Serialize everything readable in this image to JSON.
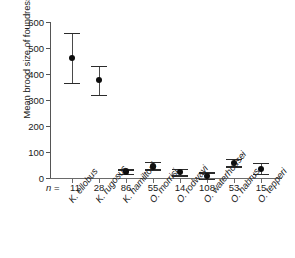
{
  "chart_data": {
    "type": "scatter",
    "title": "",
    "xlabel": "",
    "ylabel": "Mean brood size of foundress",
    "ylim": [
      0,
      600
    ],
    "yticks": [
      0,
      100,
      200,
      300,
      400,
      500,
      600
    ],
    "ytick_labels": [
      "0",
      "100",
      "200",
      "300",
      "400",
      "500",
      "600"
    ],
    "grid": false,
    "legend": "none",
    "error_bar_type": "confidence interval",
    "n_prefix": "n = ",
    "categories": [
      "K. ellobus",
      "K. rugosus",
      "K. hamiltoni",
      "O. morrisi",
      "O. rodwayi",
      "O. waterhousei",
      "O. habrus",
      "O. tepperi"
    ],
    "sample_sizes": [
      11,
      28,
      86,
      55,
      14,
      108,
      53,
      15
    ],
    "values": [
      462,
      377,
      25,
      45,
      22,
      8,
      58,
      35
    ],
    "error_low": [
      365,
      320,
      17,
      33,
      10,
      -2,
      45,
      15
    ],
    "error_high": [
      558,
      432,
      33,
      62,
      36,
      22,
      75,
      58
    ],
    "points": [
      {
        "category": "K. ellobus",
        "n": "11",
        "mean": 462,
        "low": 365,
        "high": 558
      },
      {
        "category": "K. rugosus",
        "n": "28",
        "mean": 377,
        "low": 320,
        "high": 432
      },
      {
        "category": "K. hamiltoni",
        "n": "86",
        "mean": 25,
        "low": 17,
        "high": 33
      },
      {
        "category": "O. morrisi",
        "n": "55",
        "mean": 45,
        "low": 33,
        "high": 62
      },
      {
        "category": "O. rodwayi",
        "n": "14",
        "mean": 22,
        "low": 10,
        "high": 36
      },
      {
        "category": "O. waterhousei",
        "n": "108",
        "mean": 8,
        "low": -2,
        "high": 22
      },
      {
        "category": "O. habrus",
        "n": "53",
        "mean": 58,
        "low": 45,
        "high": 75
      },
      {
        "category": "O. tepperi",
        "n": "15",
        "mean": 35,
        "low": 15,
        "high": 58
      }
    ],
    "colors": {
      "marker": "#0d0d0d",
      "error_bar": "#4a4a4a",
      "axis": "#555555",
      "background": "#ffffff"
    }
  }
}
